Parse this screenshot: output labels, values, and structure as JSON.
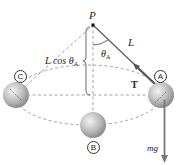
{
  "diagram": {
    "type": "conical-pendulum",
    "pivot": {
      "label": "P",
      "x": 93,
      "y": 25
    },
    "string_label": "L",
    "angle_label": "θ",
    "angle_subscript": "A",
    "height_label_prefix": "L cos θ",
    "height_label_subscript": "A",
    "tension_label": "T",
    "weight_label": "mg",
    "positions": [
      {
        "id": "A",
        "label": "A",
        "x": 161,
        "y": 95
      },
      {
        "id": "B",
        "label": "B",
        "x": 93,
        "y": 125
      },
      {
        "id": "C",
        "label": "C",
        "x": 16,
        "y": 95
      }
    ],
    "colors": {
      "string": "#555555",
      "dashed": "#888888",
      "arrow": "#666666",
      "ball_light": "#e6e6e6",
      "ball_dark": "#8c8c8c"
    }
  }
}
